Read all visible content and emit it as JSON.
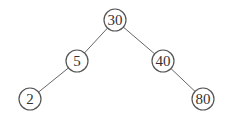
{
  "diagram": {
    "type": "binary-search-tree",
    "nodes": [
      {
        "id": "n30",
        "label": "30",
        "x": 115,
        "y": 20
      },
      {
        "id": "n5",
        "label": "5",
        "x": 77,
        "y": 61
      },
      {
        "id": "n40",
        "label": "40",
        "x": 163,
        "y": 61
      },
      {
        "id": "n2",
        "label": "2",
        "x": 30,
        "y": 99
      },
      {
        "id": "n80",
        "label": "80",
        "x": 203,
        "y": 99
      }
    ],
    "edges": [
      {
        "from": "n30",
        "to": "n5"
      },
      {
        "from": "n30",
        "to": "n40"
      },
      {
        "from": "n5",
        "to": "n2"
      },
      {
        "from": "n40",
        "to": "n80"
      }
    ]
  }
}
